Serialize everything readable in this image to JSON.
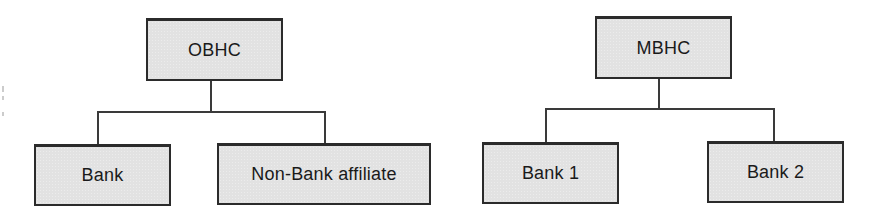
{
  "diagram": {
    "type": "org-structure",
    "colors": {
      "box_fill": "#e2e2e2",
      "box_border": "#2b2b2b",
      "line": "#3a3a3a",
      "text": "#1a1a1a"
    },
    "left_tree": {
      "root": {
        "label": "OBHC"
      },
      "children": [
        {
          "label": "Bank"
        },
        {
          "label": "Non-Bank affiliate"
        }
      ]
    },
    "right_tree": {
      "root": {
        "label": "MBHC"
      },
      "children": [
        {
          "label": "Bank 1"
        },
        {
          "label": "Bank 2"
        }
      ]
    }
  }
}
